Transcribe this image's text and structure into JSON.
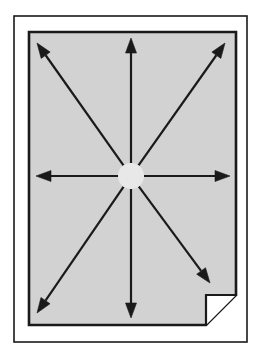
{
  "figure": {
    "domain": "Diagram",
    "type": "radial-expansion-arrows-on-page",
    "canvas": {
      "width": 259,
      "height": 357,
      "background": "#ffffff"
    },
    "outer_frame": {
      "name": "outer-frame",
      "x": 14,
      "y": 16,
      "width": 233,
      "height": 326,
      "fill": "#ffffff",
      "stroke": "#1a1a1a",
      "stroke_width": 1.6
    },
    "page": {
      "name": "page-shape",
      "x": 29,
      "y": 32,
      "width": 207,
      "height": 293,
      "fill": "#d2d2d2",
      "stroke": "#1a1a1a",
      "stroke_width": 2.6,
      "corner_fold": {
        "name": "page-corner-fold",
        "present": true,
        "corner": "bottom-right",
        "size": 30,
        "fill": "#ffffff",
        "stroke": "#1a1a1a",
        "stroke_width": 2.2
      }
    },
    "hub": {
      "name": "arrow-origin-hub",
      "cx": 131,
      "cy": 176,
      "gap_radius": 13,
      "fill": "#e8e8e8"
    },
    "arrow_style": {
      "stroke": "#1a1a1a",
      "stroke_width": 2.2,
      "head_length": 15,
      "head_width": 11,
      "head_fill": "#1a1a1a"
    },
    "arrows": [
      {
        "name": "arrow-up",
        "direction": "up",
        "label": "N",
        "tip_x": 131,
        "tip_y": 38,
        "angle_deg": 90
      },
      {
        "name": "arrow-up-right",
        "direction": "up-right",
        "label": "NE",
        "tip_x": 225,
        "tip_y": 43,
        "angle_deg": 45
      },
      {
        "name": "arrow-right",
        "direction": "right",
        "label": "E",
        "tip_x": 230,
        "tip_y": 176,
        "angle_deg": 0
      },
      {
        "name": "arrow-down-right",
        "direction": "down-right",
        "label": "SE",
        "tip_x": 210,
        "tip_y": 283,
        "angle_deg": 315
      },
      {
        "name": "arrow-down",
        "direction": "down",
        "label": "S",
        "tip_x": 131,
        "tip_y": 318,
        "angle_deg": 270
      },
      {
        "name": "arrow-down-left",
        "direction": "down-left",
        "label": "SW",
        "tip_x": 37,
        "tip_y": 313,
        "angle_deg": 225
      },
      {
        "name": "arrow-left",
        "direction": "left",
        "label": "W",
        "tip_x": 36,
        "tip_y": 176,
        "angle_deg": 180
      },
      {
        "name": "arrow-up-left",
        "direction": "up-left",
        "label": "NW",
        "tip_x": 37,
        "tip_y": 43,
        "angle_deg": 135
      }
    ],
    "alt_text": "A framed page with a folded bottom-right corner and eight arrows radiating outward from its center toward all edges and corners."
  }
}
